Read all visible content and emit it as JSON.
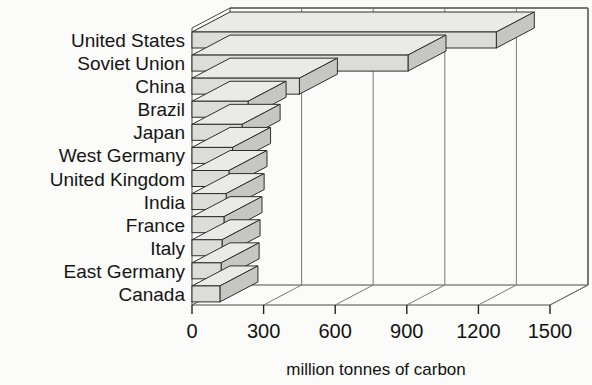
{
  "chart_data": {
    "type": "bar",
    "orientation": "horizontal",
    "style": "3d",
    "title": "",
    "subtitle": "",
    "xlabel": "million tonnes of carbon",
    "ylabel": "",
    "xlim": [
      0,
      1500
    ],
    "xticks": [
      0,
      300,
      600,
      900,
      1200,
      1500
    ],
    "xticklabels": [
      "0",
      "300",
      "600",
      "900",
      "1200",
      "1500"
    ],
    "grid": true,
    "grid_axis": "x",
    "legend": false,
    "categories": [
      "United States",
      "Soviet Union",
      "China",
      "Brazil",
      "Japan",
      "West Germany",
      "United Kingdom",
      "India",
      "France",
      "Italy",
      "East Germany",
      "Canada"
    ],
    "values": [
      1275,
      905,
      450,
      235,
      210,
      170,
      155,
      143,
      134,
      126,
      122,
      117
    ],
    "colors": {
      "bar_front": "#dcdcd8",
      "bar_top": "#eaeae6",
      "bar_side": "#c6c6c2",
      "bar_outline": "#2e2e2e",
      "frame": "#4a4a4a",
      "grid": "#7a7a7a",
      "text": "#151515",
      "background": "#fbfbfa"
    }
  }
}
